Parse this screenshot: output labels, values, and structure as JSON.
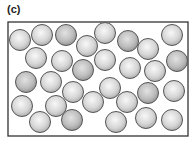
{
  "figure": {
    "label": "(c)",
    "frame": {
      "x": 8,
      "y": 22,
      "width": 180,
      "height": 114,
      "stroke": "#333333"
    },
    "particle_radius": 10.5,
    "colors": {
      "light_center": "#f7f7f7",
      "light_edge": "#b5b5b5",
      "dark_center": "#dcdcdc",
      "dark_edge": "#9a9a9a",
      "outline": "#555555"
    },
    "particles": [
      {
        "x": 20,
        "y": 40,
        "shade": "light"
      },
      {
        "x": 42,
        "y": 35,
        "shade": "light"
      },
      {
        "x": 66,
        "y": 35,
        "shade": "dark"
      },
      {
        "x": 87,
        "y": 46,
        "shade": "light"
      },
      {
        "x": 105,
        "y": 33,
        "shade": "light"
      },
      {
        "x": 128,
        "y": 41,
        "shade": "dark"
      },
      {
        "x": 148,
        "y": 49,
        "shade": "light"
      },
      {
        "x": 172,
        "y": 35,
        "shade": "light"
      },
      {
        "x": 36,
        "y": 58,
        "shade": "light"
      },
      {
        "x": 62,
        "y": 61,
        "shade": "light"
      },
      {
        "x": 83,
        "y": 70,
        "shade": "dark"
      },
      {
        "x": 105,
        "y": 60,
        "shade": "light"
      },
      {
        "x": 130,
        "y": 68,
        "shade": "light"
      },
      {
        "x": 155,
        "y": 71,
        "shade": "light"
      },
      {
        "x": 177,
        "y": 61,
        "shade": "dark"
      },
      {
        "x": 26,
        "y": 82,
        "shade": "dark"
      },
      {
        "x": 51,
        "y": 82,
        "shade": "light"
      },
      {
        "x": 73,
        "y": 92,
        "shade": "light"
      },
      {
        "x": 110,
        "y": 88,
        "shade": "light"
      },
      {
        "x": 148,
        "y": 93,
        "shade": "dark"
      },
      {
        "x": 174,
        "y": 91,
        "shade": "light"
      },
      {
        "x": 22,
        "y": 106,
        "shade": "light"
      },
      {
        "x": 56,
        "y": 106,
        "shade": "light"
      },
      {
        "x": 93,
        "y": 102,
        "shade": "light"
      },
      {
        "x": 127,
        "y": 102,
        "shade": "light"
      },
      {
        "x": 40,
        "y": 122,
        "shade": "light"
      },
      {
        "x": 72,
        "y": 120,
        "shade": "dark"
      },
      {
        "x": 116,
        "y": 122,
        "shade": "light"
      },
      {
        "x": 146,
        "y": 118,
        "shade": "light"
      },
      {
        "x": 172,
        "y": 120,
        "shade": "light"
      }
    ]
  }
}
